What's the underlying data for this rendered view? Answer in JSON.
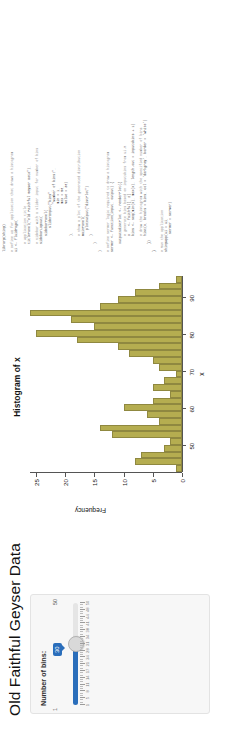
{
  "app": {
    "title": "Old Faithful Geyser Data",
    "sidebar": {
      "slider_label": "Number of bins:",
      "slider_value": "30",
      "slider_min": "1",
      "slider_max": "50",
      "tick_labels": [
        "1",
        "5",
        "8",
        "11",
        "14",
        "17",
        "21",
        "24",
        "28",
        "31",
        "34",
        "38",
        "41",
        "44",
        "48",
        "50"
      ]
    }
  },
  "chart_data": {
    "type": "bar",
    "title": "Histogram of x",
    "xlabel": "x",
    "ylabel": "Frequency",
    "bar_color": "#b5ad50",
    "grid": false,
    "legend": false,
    "xlim": [
      43,
      96
    ],
    "ylim": [
      0,
      26
    ],
    "xticks": [
      50,
      60,
      70,
      80,
      90
    ],
    "yticks": [
      0,
      5,
      10,
      15,
      20,
      25
    ],
    "bin_centers": [
      44.0,
      45.8,
      47.6,
      49.4,
      51.2,
      53.0,
      54.8,
      56.6,
      58.4,
      60.2,
      62.0,
      63.8,
      65.6,
      67.4,
      69.2,
      71.0,
      72.8,
      74.6,
      76.4,
      78.2,
      80.0,
      81.8,
      83.6,
      85.4,
      87.2,
      89.0,
      90.8,
      92.6,
      94.4
    ],
    "values": [
      1,
      8,
      7,
      3,
      2,
      12,
      14,
      4,
      6,
      10,
      5,
      2,
      5,
      3,
      1,
      4,
      5,
      9,
      11,
      18,
      25,
      15,
      19,
      26,
      14,
      11,
      8,
      4,
      1
    ]
  },
  "code": {
    "lines": [
      "library(shiny)",
      "",
      "# Define UI for application that draws a histogram",
      "ui <- fluidPage(",
      "",
      "    # Application title",
      "    titlePanel(\"Old Faithful Geyser Data\"),",
      "",
      "    # Sidebar with a slider input for number of bins",
      "    sidebarLayout(",
      "        sidebarPanel(",
      "            sliderInput(\"bins\",",
      "                        \"Number of bins:\",",
      "                        min = 1,",
      "                        max = 50,",
      "                        value = 30)",
      "        ),",
      "",
      "        # Show a plot of the generated distribution",
      "        mainPanel(",
      "           plotOutput(\"distPlot\")",
      "        )",
      "    )",
      ")",
      "",
      "# Define server logic required to draw a histogram",
      "server <- function(input, output) {",
      "",
      "    output$distPlot <- renderPlot({",
      "        # generate bins based on input$bins from ui.R",
      "        x    <- faithful[, 2]",
      "        bins <- seq(min(x), max(x), length.out = input$bins + 1)",
      "",
      "        # draw the histogram with the specified number of bins",
      "        hist(x, breaks = bins, col = 'darkgray', border = 'white')",
      "    })",
      "}",
      "",
      "# Run the application",
      "shinyApp(ui = ui,",
      "         server = server)"
    ]
  }
}
